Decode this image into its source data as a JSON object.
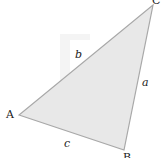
{
  "diagram": {
    "type": "triangle",
    "vertices": {
      "A": {
        "label": "A",
        "x": 19,
        "y": 115
      },
      "B": {
        "label": "B",
        "x": 124,
        "y": 150
      },
      "C": {
        "label": "C",
        "x": 153,
        "y": 5
      }
    },
    "sides": {
      "a": {
        "label": "a"
      },
      "b": {
        "label": "b"
      },
      "c": {
        "label": "c"
      }
    },
    "colors": {
      "fill": "#e8e8e8",
      "stroke": "#a8a8a8",
      "ghost": "#f3f3f3"
    }
  }
}
